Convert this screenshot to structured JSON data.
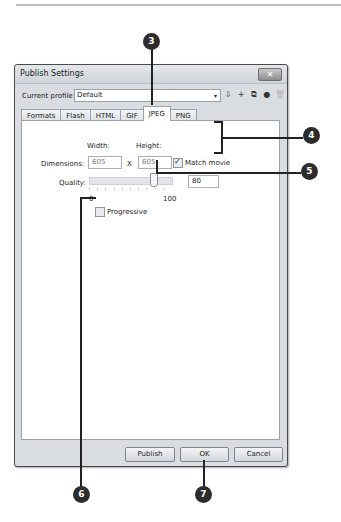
{
  "dialog": {
    "title": "Publish Settings",
    "close_glyph": "✕",
    "profile": {
      "label": "Current profile:",
      "value": "Default",
      "arrow": "▾",
      "tools": [
        {
          "name": "import-export-profile-icon",
          "glyph": "⇩"
        },
        {
          "name": "add-profile-icon",
          "glyph": "+"
        },
        {
          "name": "duplicate-profile-icon",
          "glyph": "⧉"
        },
        {
          "name": "profile-options-icon",
          "glyph": "●"
        },
        {
          "name": "delete-profile-icon",
          "glyph": "🗑"
        }
      ]
    },
    "tabs": [
      {
        "label": "Formats",
        "active": false
      },
      {
        "label": "Flash",
        "active": false
      },
      {
        "label": "HTML",
        "active": false
      },
      {
        "label": "GIF",
        "active": false
      },
      {
        "label": "JPEG",
        "active": true
      },
      {
        "label": "PNG",
        "active": false
      }
    ],
    "jpeg": {
      "width_label": "Width:",
      "height_label": "Height:",
      "dimensions_label": "Dimensions:",
      "width_value": "605",
      "x_label": "X",
      "height_value": "605",
      "match_movie_label": "Match movie",
      "match_movie_checked": true,
      "quality_label": "Quality:",
      "quality_value": "80",
      "slider_min": "0",
      "slider_max": "100",
      "progressive_label": "Progressive",
      "progressive_checked": false
    },
    "buttons": {
      "publish": "Publish",
      "ok": "OK",
      "cancel": "Cancel"
    }
  },
  "callouts": {
    "c3": "3",
    "c4": "4",
    "c5": "5",
    "c6": "6",
    "c7": "7"
  }
}
